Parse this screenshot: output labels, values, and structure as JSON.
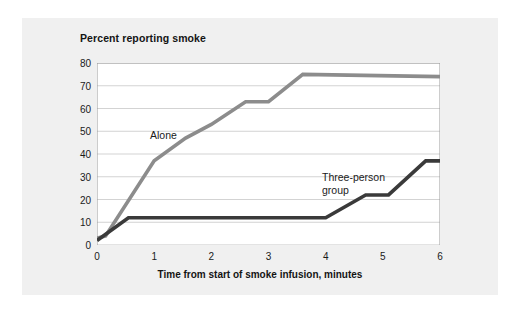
{
  "chart_data": {
    "type": "line",
    "title": "Percent reporting smoke",
    "xlabel": "Time from start of smoke infusion, minutes",
    "ylabel": "",
    "xlim": [
      0,
      6
    ],
    "ylim": [
      0,
      80
    ],
    "grid": true,
    "legend_position": "inline-annotations",
    "xticks": [
      "0",
      "1",
      "2",
      "3",
      "4",
      "5",
      "6"
    ],
    "yticks": [
      "0",
      "10",
      "20",
      "30",
      "40",
      "50",
      "60",
      "70",
      "80"
    ],
    "series": [
      {
        "name": "Alone",
        "color": "#8c8c8c",
        "x": [
          0,
          0.15,
          1.0,
          1.55,
          2.0,
          2.6,
          3.0,
          3.6,
          6.0
        ],
        "values": [
          3,
          4,
          37,
          47,
          53,
          63,
          63,
          75,
          74
        ]
      },
      {
        "name": "Three-person group",
        "color": "#3a3a3a",
        "x": [
          0,
          0.55,
          4.0,
          4.7,
          5.1,
          5.75,
          6.0
        ],
        "values": [
          2,
          12,
          12,
          22,
          22,
          37,
          37
        ]
      }
    ],
    "annotations": [
      {
        "text": "Alone",
        "x": 1.5,
        "y": 47
      },
      {
        "text": "Three-person\ngroup",
        "x": 4.0,
        "y": 33
      }
    ]
  },
  "axis": {
    "yticks": [
      "80",
      "70",
      "60",
      "50",
      "40",
      "30",
      "20",
      "10",
      "0"
    ],
    "xticks": [
      "0",
      "1",
      "2",
      "3",
      "4",
      "5",
      "6"
    ]
  }
}
